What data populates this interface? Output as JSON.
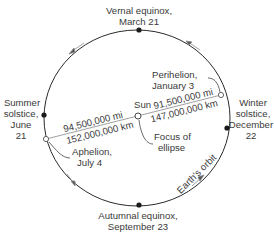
{
  "diagram": {
    "type": "earth-orbit",
    "colors": {
      "line": "#2a2a2a",
      "thin_line": "#777777",
      "text": "#3a3a3a",
      "dot": "#1a1a1a",
      "background": "#ffffff"
    },
    "orbit_label": "Earth's orbit",
    "points": {
      "vernal": {
        "line1": "Vernal equinox,",
        "line2": "March 21"
      },
      "autumnal": {
        "line1": "Autumnal equinox,",
        "line2": "September 23"
      },
      "summer": {
        "line1": "Summer",
        "line2": "solstice,",
        "line3": "June",
        "line4": "21"
      },
      "winter": {
        "line1": "Winter",
        "line2": "solstice,",
        "line3": "December",
        "line4": "22"
      },
      "perihelion": {
        "line1": "Perihelion,",
        "line2": "January 3"
      },
      "aphelion": {
        "line1": "Aphelion,",
        "line2": "July 4"
      }
    },
    "sun": {
      "label": "Sun",
      "focus_line1": "Focus of",
      "focus_line2": "ellipse"
    },
    "distances": {
      "aphelion_mi": "94,500,000 mi",
      "aphelion_km": "152,000,000 km",
      "perihelion_mi": "91,500,000 mi",
      "perihelion_km": "147,000,000 km"
    }
  }
}
